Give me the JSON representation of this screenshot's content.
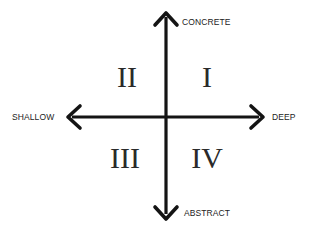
{
  "diagram": {
    "type": "quadrant",
    "colors": {
      "axis": "#141414",
      "text": "#222222",
      "numeral": "#2a2a2a",
      "background": "#ffffff"
    },
    "axes": {
      "vertical": {
        "top_label": "CONCRETE",
        "bottom_label": "ABSTRACT"
      },
      "horizontal": {
        "left_label": "SHALLOW",
        "right_label": "DEEP"
      }
    },
    "quadrants": [
      {
        "id": "q1",
        "label": "I",
        "position": "top-right"
      },
      {
        "id": "q2",
        "label": "II",
        "position": "top-left"
      },
      {
        "id": "q3",
        "label": "III",
        "position": "bottom-left"
      },
      {
        "id": "q4",
        "label": "IV",
        "position": "bottom-right"
      }
    ]
  }
}
